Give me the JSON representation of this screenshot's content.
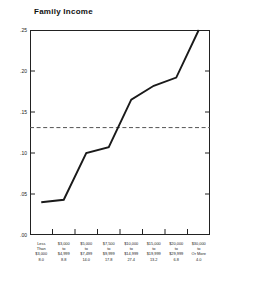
{
  "chart": {
    "title": "Family Income"
  },
  "axis": {
    "y_tick_labels": [
      ".25",
      ".20",
      ".15",
      ".10",
      ".05",
      ".00"
    ]
  },
  "chart_data": {
    "type": "line",
    "title": "Family Income",
    "xlabel": "",
    "ylabel": "",
    "ylim": [
      0.0,
      0.25
    ],
    "yticks": [
      0.0,
      0.05,
      0.1,
      0.15,
      0.2,
      0.25
    ],
    "ytick_labels": [
      ".00",
      ".05",
      ".10",
      ".15",
      ".20",
      ".25"
    ],
    "grid": false,
    "legend": "none",
    "categories": [
      "Less Than $3,000",
      "$3,000 to $4,999",
      "$5,000 to $7,499",
      "$7,500 to $9,999",
      "$10,000 to $14,999",
      "$15,000 to $19,999",
      "$20,000 to $29,999",
      "$30,000 Or More"
    ],
    "category_lines": [
      [
        "Less",
        "Than",
        "$3,000"
      ],
      [
        "$3,000",
        "to",
        "$4,999"
      ],
      [
        "$5,000",
        "to",
        "$7,499"
      ],
      [
        "$7,500",
        "to",
        "$9,999"
      ],
      [
        "$10,000",
        "to",
        "$14,999"
      ],
      [
        "$15,000",
        "to",
        "$19,999"
      ],
      [
        "$20,000",
        "to",
        "$29,999"
      ],
      [
        "$30,000",
        "to",
        "Or More"
      ]
    ],
    "category_percents": [
      "8.0",
      "8.8",
      "14.0",
      "17.8",
      "27.4",
      "13.2",
      "6.8",
      "4.0"
    ],
    "values": [
      0.04,
      0.043,
      0.1,
      0.107,
      0.165,
      0.182,
      0.192,
      0.25
    ],
    "reference_line": {
      "value": 0.131,
      "style": "dashed",
      "label": ""
    },
    "series": [
      {
        "name": "Family Income",
        "values": [
          0.04,
          0.043,
          0.1,
          0.107,
          0.165,
          0.182,
          0.192,
          0.25
        ]
      }
    ]
  },
  "style": {
    "line_color": "#1a1a1a",
    "reference_color": "#555555",
    "frame_color": "#222222"
  }
}
